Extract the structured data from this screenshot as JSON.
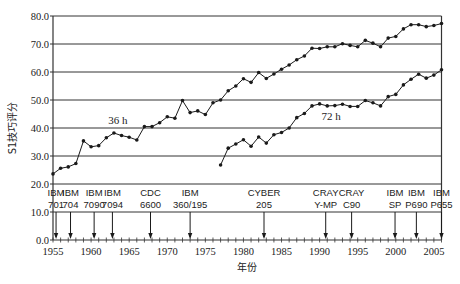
{
  "chart_data": {
    "type": "line",
    "title": "",
    "xlabel": "年份",
    "ylabel": "S1技巧评分",
    "xlim": [
      1955,
      2006
    ],
    "ylim": [
      0,
      80
    ],
    "grid": "horizontal",
    "xticks": [
      1955,
      1960,
      1965,
      1970,
      1975,
      1980,
      1985,
      1990,
      1995,
      2000,
      2005
    ],
    "yticks": [
      "0.0",
      "10.0",
      "20.0",
      "30.0",
      "40.0",
      "50.0",
      "60.0",
      "70.0",
      "80.0"
    ],
    "series": [
      {
        "name": "36 h",
        "label_pos": {
          "x": 1963.5,
          "y": 41.5
        },
        "x": [
          1955,
          1956,
          1957,
          1958,
          1959,
          1960,
          1961,
          1962,
          1963,
          1964,
          1965,
          1966,
          1967,
          1968,
          1969,
          1970,
          1971,
          1972,
          1973,
          1974,
          1975,
          1976,
          1977,
          1978,
          1979,
          1980,
          1981,
          1982,
          1983,
          1984,
          1985,
          1986,
          1987,
          1988,
          1989,
          1990,
          1991,
          1992,
          1993,
          1994,
          1995,
          1996,
          1997,
          1998,
          1999,
          2000,
          2001,
          2002,
          2003,
          2004,
          2005,
          2006
        ],
        "values": [
          23.6,
          25.6,
          26.1,
          27.3,
          35.4,
          33.3,
          33.7,
          36.5,
          38.2,
          37.3,
          36.7,
          35.7,
          40.5,
          40.5,
          41.9,
          44.0,
          43.5,
          49.8,
          45.5,
          46.1,
          44.8,
          49.0,
          50.0,
          53.3,
          55.0,
          57.6,
          56.3,
          59.8,
          57.7,
          59.3,
          61.0,
          62.5,
          64.4,
          65.7,
          68.5,
          68.4,
          69.0,
          69.0,
          70.1,
          69.5,
          69.0,
          71.3,
          70.3,
          69.0,
          72.1,
          72.7,
          75.4,
          76.9,
          76.9,
          76.2,
          76.6,
          77.3
        ]
      },
      {
        "name": "72 h",
        "label_pos": {
          "x": 1991.5,
          "y": 43.0
        },
        "x": [
          1977,
          1978,
          1979,
          1980,
          1981,
          1982,
          1983,
          1984,
          1985,
          1986,
          1987,
          1988,
          1989,
          1990,
          1991,
          1992,
          1993,
          1994,
          1995,
          1996,
          1997,
          1998,
          1999,
          2000,
          2001,
          2002,
          2003,
          2004,
          2005,
          2006
        ],
        "values": [
          26.8,
          32.8,
          34.3,
          35.8,
          33.5,
          36.8,
          34.6,
          37.6,
          38.4,
          40.0,
          43.7,
          45.2,
          47.9,
          48.6,
          47.9,
          48.0,
          48.5,
          47.7,
          47.7,
          49.8,
          49.0,
          47.9,
          51.2,
          52.0,
          55.4,
          57.4,
          59.2,
          57.8,
          58.9,
          60.8
        ]
      }
    ],
    "annotations": [
      {
        "line1": "IBM",
        "line2": "701",
        "year": 1955.4
      },
      {
        "line1": "IBM",
        "line2": "704",
        "year": 1957.3
      },
      {
        "line1": "IBM",
        "line2": "7090",
        "year": 1960.4
      },
      {
        "line1": "IBM",
        "line2": "7094",
        "year": 1962.8
      },
      {
        "line1": "CDC",
        "line2": "6600",
        "year": 1967.8
      },
      {
        "line1": "IBM",
        "line2": "360/195",
        "year": 1973.0
      },
      {
        "line1": "CYBER",
        "line2": "205",
        "year": 1982.7
      },
      {
        "line1": "CRAY",
        "line2": "Y-MP",
        "year": 1990.8
      },
      {
        "line1": "CRAY",
        "line2": "C90",
        "year": 1994.2
      },
      {
        "line1": "IBM",
        "line2": "SP",
        "year": 1999.9
      },
      {
        "line1": "IBM",
        "line2": "P690",
        "year": 2002.7
      },
      {
        "line1": "IBM",
        "line2": "P655",
        "year": 2006.0
      }
    ]
  },
  "colors": {
    "line": "#1a1a1a",
    "grid": "#333333",
    "background": "#ffffff"
  }
}
